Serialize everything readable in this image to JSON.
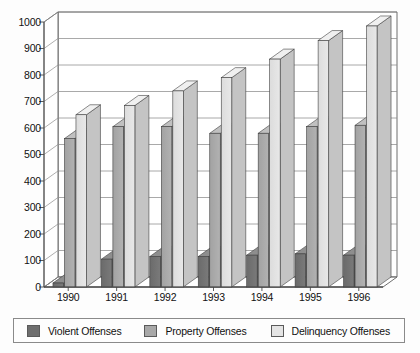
{
  "chart_data": {
    "type": "bar",
    "title": "",
    "subtitle": "",
    "xlabel": "",
    "ylabel": "",
    "categories": [
      "1990",
      "1991",
      "1992",
      "1993",
      "1994",
      "1995",
      "1996"
    ],
    "series": [
      {
        "name": "Violent Offenses",
        "color": "#6e6e6e",
        "values": [
          15,
          105,
          115,
          115,
          120,
          125,
          120
        ]
      },
      {
        "name": "Property Offenses",
        "color": "#a8a8a8",
        "values": [
          560,
          605,
          605,
          580,
          580,
          605,
          610
        ]
      },
      {
        "name": "Delinquency Offenses",
        "color": "#dedede",
        "values": [
          650,
          685,
          740,
          790,
          860,
          930,
          985
        ]
      }
    ],
    "ylim": [
      0,
      1000
    ],
    "ytick_values": [
      0,
      100,
      200,
      300,
      400,
      500,
      600,
      700,
      800,
      900,
      1000
    ],
    "ytick_labels": [
      "0",
      "100",
      "200",
      "300",
      "400",
      "500",
      "600",
      "700",
      "800",
      "900",
      "1000"
    ],
    "grid": true,
    "grid_axis": "y",
    "legend_position": "bottom",
    "style": "3d-grouped-column-grayscale"
  },
  "legend": {
    "items": [
      {
        "label": "Violent Offenses",
        "swatch_color": "#6e6e6e"
      },
      {
        "label": "Property Offenses",
        "swatch_color": "#a8a8a8"
      },
      {
        "label": "Delinquency Offenses",
        "swatch_color": "#e4e4e4"
      }
    ]
  },
  "axes": {
    "y": {
      "ticks": [
        "1000",
        "900",
        "800",
        "700",
        "600",
        "500",
        "400",
        "300",
        "200",
        "100",
        "0"
      ]
    },
    "x": {
      "ticks": [
        "1990",
        "1991",
        "1992",
        "1993",
        "1994",
        "1995",
        "1996"
      ]
    }
  },
  "colors": {
    "plot_background": "#ffffff",
    "grid_line": "#8c8c8c",
    "axis_line": "#4a4a4a",
    "page_background": "#fdfdfd"
  }
}
